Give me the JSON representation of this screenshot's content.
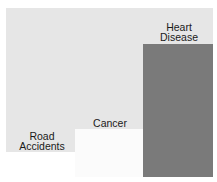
{
  "chart_data": {
    "type": "area",
    "title": "",
    "categories": [
      "Road Accidents",
      "Cancer",
      "Heart Disease"
    ],
    "values": [
      0,
      3264,
      9310
    ],
    "units": "relative area (px²)",
    "labels": {
      "road": [
        "Road",
        "Accidents"
      ],
      "cancer": [
        "Cancer"
      ],
      "heart": [
        "Heart",
        "Disease"
      ]
    },
    "colors": {
      "background": "#e6e6e6",
      "cancer": "#fbfbfb",
      "heart_disease": "#7a7a7a"
    },
    "legend": "none",
    "grid": false
  }
}
